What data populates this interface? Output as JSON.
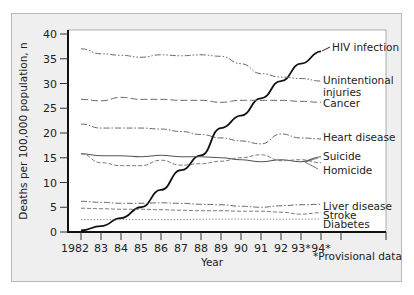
{
  "chart_data": {
    "type": "line",
    "title": "",
    "xlabel": "Year",
    "ylabel": "Deaths per 100,000 population, n",
    "x": [
      "1982",
      "83",
      "84",
      "85",
      "86",
      "87",
      "88",
      "89",
      "90",
      "91",
      "92",
      "93*",
      "94*"
    ],
    "ylim": [
      0,
      40
    ],
    "yticks": [
      0,
      5,
      10,
      15,
      20,
      25,
      30,
      35,
      40
    ],
    "grid": false,
    "legend_position": "right, inline labels at line ends",
    "footnote": "*Provisional data",
    "series": [
      {
        "name": "HIV infection",
        "style": "solid",
        "values": [
          0.3,
          1.2,
          2.8,
          5.0,
          8.5,
          12.5,
          15.5,
          21.0,
          23.5,
          27.0,
          30.5,
          34.0,
          36.5
        ]
      },
      {
        "name": "Unintentional injuries",
        "style": "dash-dot-dot",
        "values": [
          37.0,
          36.0,
          35.7,
          35.3,
          35.8,
          35.6,
          35.8,
          35.5,
          34.0,
          32.0,
          31.3,
          31.0,
          30.5
        ]
      },
      {
        "name": "Cancer",
        "style": "long-dash",
        "values": [
          26.8,
          26.5,
          27.2,
          26.8,
          26.8,
          26.6,
          26.6,
          26.2,
          26.6,
          26.6,
          26.6,
          26.4,
          26.2
        ]
      },
      {
        "name": "Heart disease",
        "style": "dash-dot",
        "values": [
          21.8,
          21.0,
          21.0,
          21.0,
          20.8,
          20.3,
          19.7,
          19.0,
          18.4,
          17.8,
          19.8,
          19.0,
          18.8
        ]
      },
      {
        "name": "Suicide",
        "style": "solid-thin",
        "values": [
          15.8,
          15.4,
          15.4,
          15.2,
          15.5,
          15.2,
          15.2,
          15.0,
          14.6,
          14.2,
          14.6,
          14.2,
          15.2
        ]
      },
      {
        "name": "Homicide",
        "style": "dashed",
        "values": [
          15.8,
          14.0,
          13.4,
          13.4,
          14.5,
          13.5,
          13.8,
          14.3,
          15.0,
          15.6,
          14.4,
          14.6,
          14.0
        ]
      },
      {
        "name": "Liver disease",
        "style": "dash-dot",
        "values": [
          6.2,
          6.0,
          5.8,
          5.8,
          5.9,
          5.8,
          5.6,
          5.5,
          5.2,
          5.0,
          5.3,
          5.5,
          5.6
        ]
      },
      {
        "name": "Stroke",
        "style": "dashed",
        "values": [
          4.8,
          4.7,
          4.6,
          4.6,
          4.5,
          4.4,
          4.3,
          4.3,
          4.2,
          4.2,
          4.0,
          3.6,
          3.9
        ]
      },
      {
        "name": "Diabetes",
        "style": "dotted",
        "values": [
          2.5,
          2.5,
          2.5,
          2.5,
          2.5,
          2.5,
          2.6,
          2.6,
          2.6,
          2.6,
          2.6,
          2.6,
          2.6
        ]
      }
    ]
  },
  "labels": {
    "ylabel": "Deaths per 100,000 population, n",
    "xlabel": "Year",
    "footnote": "*Provisional data",
    "legend": {
      "hiv": "HIV infection",
      "injuries_1": "Unintentional",
      "injuries_2": "injuries",
      "cancer": "Cancer",
      "heart": "Heart disease",
      "suicide": "Suicide",
      "homicide": "Homicide",
      "liver": "Liver disease",
      "stroke": "Stroke",
      "diabetes": "Diabetes"
    }
  }
}
